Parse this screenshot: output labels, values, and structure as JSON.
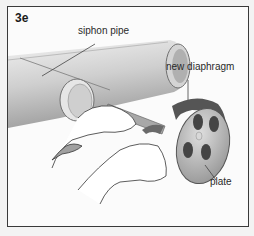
{
  "figure": {
    "number": "3e",
    "labels": {
      "siphon_pipe": "siphon pipe",
      "new_diaphragm": "new diaphragm",
      "plate": "plate"
    }
  },
  "colors": {
    "frame": "#3a3a3a",
    "pipe_light": "#e0e0e0",
    "pipe_dark": "#9a9a9a",
    "plate": "#b8b8b8",
    "diaphragm": "#555555",
    "holes": "#444444"
  }
}
